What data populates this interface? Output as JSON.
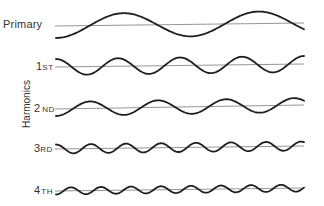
{
  "diagram": {
    "title": "",
    "axis_label": "Harmonics",
    "rows": [
      {
        "id": "primary",
        "label_main": "Primary",
        "label_suffix": "",
        "baseline": [
          26,
          23
        ],
        "amplitude": 12,
        "period": 135,
        "phase": 0.0
      },
      {
        "id": "1st",
        "label_main": "1",
        "label_suffix": "ST",
        "baseline": [
          67,
          64
        ],
        "amplitude": 8,
        "period": 62,
        "phase": 0.5
      },
      {
        "id": "2nd",
        "label_main": "2",
        "label_suffix": "ND",
        "baseline": [
          109,
          105
        ],
        "amplitude": 7,
        "period": 68,
        "phase": 0.0
      },
      {
        "id": "3rd",
        "label_main": "3",
        "label_suffix": "RD",
        "baseline": [
          149,
          146
        ],
        "amplitude": 4.5,
        "period": 35,
        "phase": 0.5
      },
      {
        "id": "4th",
        "label_main": "4",
        "label_suffix": "TH",
        "baseline": [
          191,
          188
        ],
        "amplitude": 3.5,
        "period": 30,
        "phase": 0.0
      }
    ],
    "x_start": 56,
    "x_end": 304,
    "colors": {
      "wave": "#1e1e1e",
      "baseline": "#8a8a8a",
      "text": "#333333"
    }
  }
}
